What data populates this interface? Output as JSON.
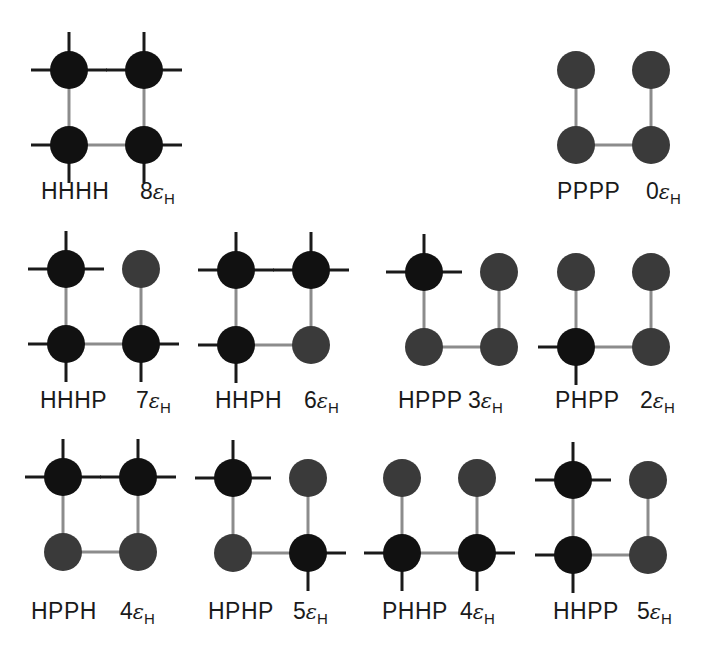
{
  "figure": {
    "colors": {
      "background": "#ffffff",
      "h_residue": "#111111",
      "p_residue": "#3a3a3a",
      "chain_bond": "#8c8c8c",
      "contact_tick": "#1a1a1a",
      "text": "#1a1a1a"
    },
    "energy_symbol": "ε",
    "energy_subscript": "H",
    "chain_order": [
      "top-left",
      "bottom-left",
      "bottom-right",
      "top-right"
    ],
    "configurations": [
      {
        "sequence": "HHHH",
        "energy_multiplier": "8",
        "x": 69,
        "y": 70,
        "label_x": 41,
        "label_y": 180,
        "energy_x": 140
      },
      {
        "sequence": "PPPP",
        "energy_multiplier": "0",
        "x": 576,
        "y": 70,
        "label_x": 557,
        "label_y": 180,
        "energy_x": 646
      },
      {
        "sequence": "HHHP",
        "energy_multiplier": "7",
        "x": 66,
        "y": 269,
        "label_x": 40,
        "label_y": 389,
        "energy_x": 136
      },
      {
        "sequence": "HHPH",
        "energy_multiplier": "6",
        "x": 236,
        "y": 270,
        "label_x": 215,
        "label_y": 389,
        "energy_x": 304
      },
      {
        "sequence": "HPPP",
        "energy_multiplier": "3",
        "x": 424,
        "y": 272,
        "label_x": 398,
        "label_y": 389,
        "energy_x": 468
      },
      {
        "sequence": "PHPP",
        "energy_multiplier": "2",
        "x": 576,
        "y": 272,
        "label_x": 555,
        "label_y": 389,
        "energy_x": 640
      },
      {
        "sequence": "HPPH",
        "energy_multiplier": "4",
        "x": 63,
        "y": 477,
        "label_x": 31,
        "label_y": 600,
        "energy_x": 120
      },
      {
        "sequence": "HPHP",
        "energy_multiplier": "5",
        "x": 233,
        "y": 478,
        "label_x": 208,
        "label_y": 600,
        "energy_x": 293
      },
      {
        "sequence": "PHHP",
        "energy_multiplier": "4",
        "x": 402,
        "y": 478,
        "label_x": 382,
        "label_y": 600,
        "energy_x": 460
      },
      {
        "sequence": "HHPP",
        "energy_multiplier": "5",
        "x": 573,
        "y": 480,
        "label_x": 553,
        "label_y": 600,
        "energy_x": 637
      }
    ]
  },
  "layout": {
    "spacing": 75,
    "radius": 19,
    "tick_length": 19,
    "bond_width": 3,
    "tick_width": 3
  }
}
